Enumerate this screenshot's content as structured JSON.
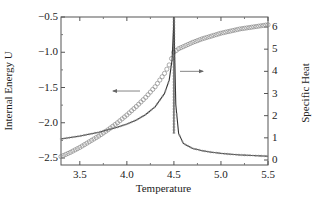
{
  "chart_data": {
    "type": "line",
    "title": "",
    "xlabel": "Temperature",
    "ylabel": "Internal Energy U",
    "y2label": "Specific Heat",
    "xlim": [
      3.3,
      5.5
    ],
    "ylim": [
      -2.5,
      -0.5
    ],
    "y2lim": [
      0,
      6.3
    ],
    "x_ticks": [
      "3.5",
      "4.0",
      "4.5",
      "5.0",
      "5.5"
    ],
    "y_ticks": [
      "-0.5",
      "-1.0",
      "-1.5",
      "-2.0",
      "-2.5"
    ],
    "y2_ticks": [
      "6",
      "5",
      "4",
      "3",
      "2",
      "1",
      "0"
    ],
    "grid": false,
    "legend": null,
    "annotations": [
      {
        "type": "arrow",
        "direction": "left",
        "meaning": "circles refer to left axis (Internal Energy U)",
        "x": 4.15,
        "y": -1.55
      },
      {
        "type": "arrow",
        "direction": "right",
        "meaning": "line refers to right axis (Specific Heat)",
        "x": 4.8,
        "y": 4.0
      }
    ],
    "series": [
      {
        "name": "Internal Energy U",
        "axis": "left",
        "style": "open circles",
        "x": [
          3.3,
          3.4,
          3.5,
          3.6,
          3.7,
          3.8,
          3.9,
          4.0,
          4.1,
          4.2,
          4.3,
          4.4,
          4.45,
          4.5,
          4.55,
          4.6,
          4.7,
          4.8,
          4.9,
          5.0,
          5.1,
          5.2,
          5.3,
          5.4,
          5.5
        ],
        "values": [
          -2.48,
          -2.42,
          -2.35,
          -2.27,
          -2.19,
          -2.1,
          -2.0,
          -1.89,
          -1.77,
          -1.64,
          -1.49,
          -1.3,
          -1.18,
          -1.0,
          -0.95,
          -0.92,
          -0.86,
          -0.81,
          -0.77,
          -0.73,
          -0.7,
          -0.67,
          -0.65,
          -0.63,
          -0.61
        ]
      },
      {
        "name": "Specific Heat",
        "axis": "right",
        "style": "solid line with crosses",
        "x": [
          3.3,
          3.5,
          3.7,
          3.9,
          4.0,
          4.1,
          4.2,
          4.3,
          4.4,
          4.45,
          4.48,
          4.5,
          4.52,
          4.55,
          4.6,
          4.7,
          4.8,
          4.9,
          5.0,
          5.1,
          5.2,
          5.3,
          5.4,
          5.5
        ],
        "values": [
          0.95,
          1.08,
          1.25,
          1.48,
          1.62,
          1.8,
          2.05,
          2.4,
          3.0,
          3.6,
          4.5,
          6.3,
          2.5,
          1.2,
          0.75,
          0.52,
          0.42,
          0.35,
          0.3,
          0.26,
          0.23,
          0.21,
          0.19,
          0.17
        ]
      }
    ]
  }
}
